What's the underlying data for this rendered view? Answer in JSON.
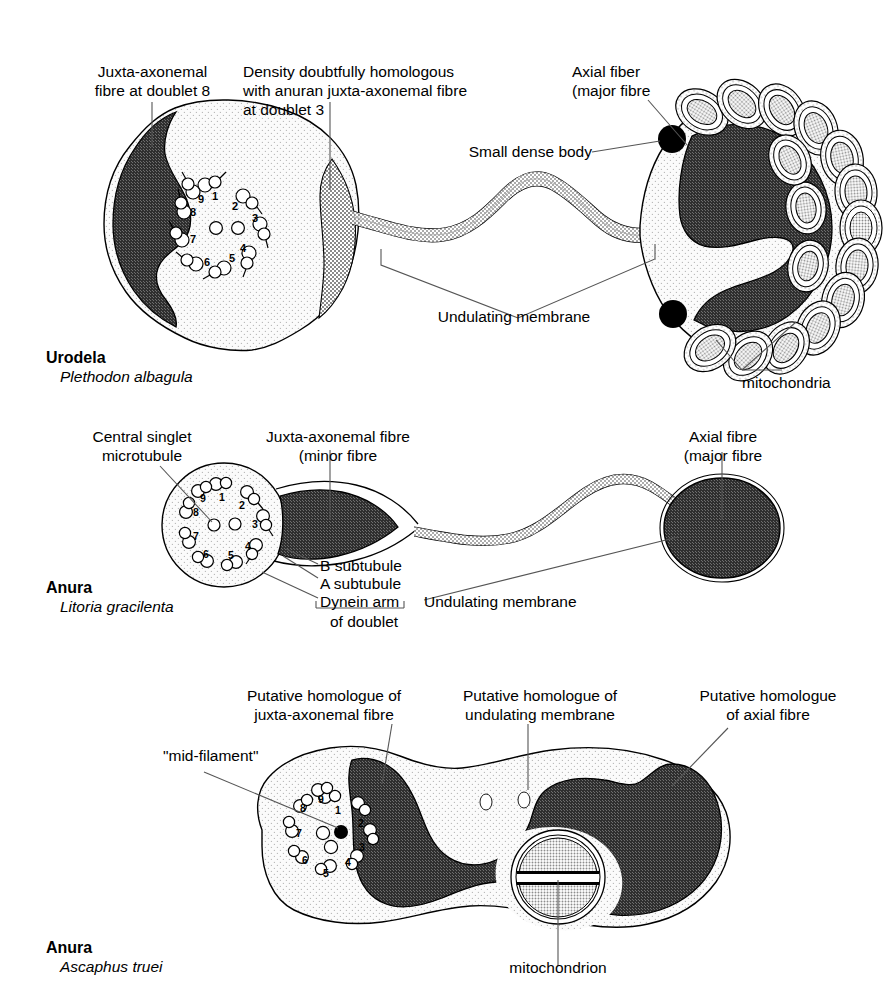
{
  "figure": {
    "type": "diagram",
    "panel_count": 3
  },
  "panels": [
    {
      "id": "panel-urodela",
      "taxon_group": "Urodela",
      "species": "Plethodon albagula",
      "labels": [
        {
          "id": "juxta-axonemal-doublet8",
          "text": "Juxta-axonemal\nfibre at doublet 8"
        },
        {
          "id": "density-doubtful",
          "text": "Density doubtfully homologous\nwith anuran juxta-axonemal fibre\nat doublet 3"
        },
        {
          "id": "axial-fiber",
          "text": "Axial fiber\n(major fibre"
        },
        {
          "id": "small-dense-body",
          "text": "Small dense body"
        },
        {
          "id": "undulating-membrane",
          "text": "Undulating membrane"
        },
        {
          "id": "mitochondria",
          "text": "mitochondria"
        }
      ],
      "axoneme": {
        "doublet_numbers": [
          "1",
          "2",
          "3",
          "4",
          "5",
          "6",
          "7",
          "8",
          "9"
        ],
        "central_singlets": 2
      },
      "mitochondria_count": 16,
      "dense_bodies": 2
    },
    {
      "id": "panel-anura-litoria",
      "taxon_group": "Anura",
      "species": "Litoria gracilenta",
      "labels": [
        {
          "id": "central-singlet",
          "text": "Central singlet\nmicrotubule"
        },
        {
          "id": "juxta-axonemal-minor",
          "text": "Juxta-axonemal fibre\n(minor fibre"
        },
        {
          "id": "axial-fibre-major",
          "text": "Axial fibre\n(major fibre"
        },
        {
          "id": "b-subtubule",
          "text": "B subtubule"
        },
        {
          "id": "a-subtubule",
          "text": "A subtubule"
        },
        {
          "id": "dynein-arm",
          "text": "Dynein arm"
        },
        {
          "id": "of-doublet",
          "text": "of doublet"
        },
        {
          "id": "undulating-membrane",
          "text": "Undulating membrane"
        }
      ],
      "axoneme": {
        "doublet_numbers": [
          "1",
          "2",
          "3",
          "4",
          "5",
          "6",
          "7",
          "8",
          "9"
        ],
        "central_singlets": 2
      }
    },
    {
      "id": "panel-anura-ascaphus",
      "taxon_group": "Anura",
      "species": "Ascaphus truei",
      "labels": [
        {
          "id": "mid-filament",
          "text": "\"mid-filament\""
        },
        {
          "id": "putative-juxta",
          "text": "Putative homologue of\njuxta-axonemal fibre"
        },
        {
          "id": "putative-undulating",
          "text": "Putative homologue of\nundulating membrane"
        },
        {
          "id": "putative-axial",
          "text": "Putative homologue\nof axial fibre"
        },
        {
          "id": "mitochondrion",
          "text": "mitochondrion"
        }
      ],
      "axoneme": {
        "doublet_numbers": [
          "1",
          "2",
          "3",
          "4",
          "5",
          "6",
          "7",
          "8",
          "9"
        ],
        "central_singlets": 2,
        "mid_filament": 1
      },
      "mitochondrion_count": 1,
      "vesicles": 2
    }
  ],
  "colors": {
    "dark_fiber": "#3a3a3a",
    "medium_gray": "#9a9a9a",
    "light_cytoplasm": "#f4f4f4",
    "outline": "#000000",
    "mito_matrix": "#8f8f8f",
    "leader_line": "#555555"
  }
}
